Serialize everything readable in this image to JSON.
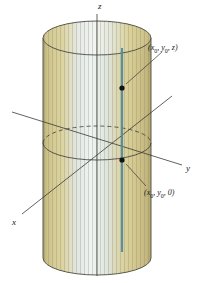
{
  "figure": {
    "type": "3d-geometry-diagram",
    "background_color": "#ffffff"
  },
  "axes": {
    "x": {
      "label": "x",
      "label_x": 13,
      "label_y": 222
    },
    "y": {
      "label": "y",
      "label_x": 186,
      "label_y": 169
    },
    "z": {
      "label": "z",
      "label_x": 98,
      "label_y": 3
    },
    "color": "#3a3a33",
    "origin": {
      "x": 97,
      "y": 143
    }
  },
  "points": [
    {
      "id": "upper-point",
      "label_open": "(",
      "label_x": "x",
      "label_x_sub": "0",
      "label_sep1": ", ",
      "label_y": "y",
      "label_y_sub": "0",
      "label_sep2": ", ",
      "label_z": "z",
      "label_close": ")",
      "full_label": "(x0, y0, z)",
      "dot_x": 122,
      "dot_y": 88,
      "text_x": 148,
      "text_y": 45,
      "leader_to_x": 126,
      "leader_to_y": 84
    },
    {
      "id": "lower-point",
      "label_open": "(",
      "label_x": "x",
      "label_x_sub": "0",
      "label_sep1": ", ",
      "label_y": "y",
      "label_y_sub": "0",
      "label_sep2": ", ",
      "label_z": "0",
      "label_close": ")",
      "full_label": "(x0, y0, 0)",
      "dot_x": 122,
      "dot_y": 160,
      "text_x": 144,
      "text_y": 190,
      "leader_to_x": 126,
      "leader_to_y": 164
    }
  ],
  "cylinder": {
    "center_x": 97,
    "radius_x": 54,
    "radius_y": 17,
    "top_y": 38,
    "bottom_y": 258,
    "outline_color": "#4a4a40",
    "stripe_colors": {
      "edge_tan": "#c9bd85",
      "mid_tan": "#d8cf9c",
      "pale": "#dfe7e6",
      "highlight": "#eef2f0",
      "right_tan": "#cdc189"
    }
  },
  "cross_section_ellipse": {
    "center_x": 97,
    "center_y": 143,
    "radius_x": 54,
    "radius_y": 17,
    "front_style": "solid",
    "back_style": "dashed",
    "color": "#3a3a33"
  },
  "generator_line": {
    "x": 122,
    "top_y": 48,
    "bottom_y": 252,
    "color": "#4d8b9c",
    "description": "vertical teal line on cylinder surface"
  },
  "colors": {
    "ink": "#3a3a33",
    "teal": "#4d8b9c",
    "tan": "#c9bd85",
    "pale_blue": "#dfe7e6"
  }
}
